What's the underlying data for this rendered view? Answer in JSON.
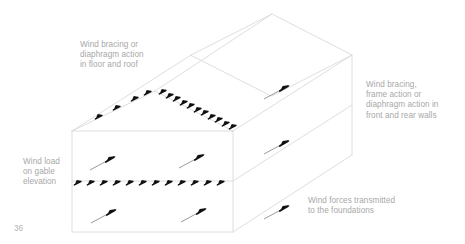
{
  "page": {
    "number": "36",
    "background_color": "#ffffff",
    "line_color": "#d9d9d9",
    "arrow_color": "#1a1a1a",
    "text_color": "#a8a8a8"
  },
  "annotations": {
    "roof_diaphragm": "Wind bracing or\ndiaphragm action\nin floor and roof",
    "side_walls": "Wind bracing,\nframe action or\ndiaphragm action in\nfront and rear walls",
    "gable_load": "Wind load\non gable\nelevation",
    "foundations": "Wind forces transmitted\nto the foundations"
  },
  "diagram": {
    "type": "axonometric-line-drawing",
    "building_outline": {
      "near_gable": {
        "eave_left": [
          72,
          131
        ],
        "eave_right": [
          233,
          131
        ],
        "base_left": [
          72,
          232
        ],
        "base_right": [
          233,
          232
        ],
        "apex": [
          155,
          91
        ]
      },
      "far_gable": {
        "eave_left": [
          191,
          55
        ],
        "eave_right": [
          352,
          55
        ],
        "base_right": [
          352,
          155
        ],
        "apex": [
          272,
          14
        ]
      },
      "mid_floor_line_y": 181
    },
    "arrow_groups": [
      {
        "name": "gable-mid-floor-arrows",
        "style": "short",
        "count": 12,
        "x_start": 78,
        "x_step": 13.2,
        "y": 181
      },
      {
        "name": "right-roof-eave-arrows",
        "style": "short",
        "count": 11,
        "from": [
          163,
          88
        ],
        "to": [
          232,
          124
        ]
      },
      {
        "name": "left-roof-slope-arrows",
        "style": "short",
        "count": 4,
        "from": [
          99,
          117
        ],
        "to": [
          148,
          93
        ]
      },
      {
        "name": "gable-upper-wall-long-arrows",
        "style": "long",
        "count": 2,
        "positions": [
          [
            89,
            169
          ],
          [
            178,
            166
          ]
        ]
      },
      {
        "name": "gable-lower-wall-long-arrows",
        "style": "long",
        "count": 2,
        "positions": [
          [
            90,
            222
          ],
          [
            180,
            221
          ]
        ]
      },
      {
        "name": "side-wall-upper-long-arrow",
        "style": "long",
        "count": 1,
        "positions": [
          [
            271,
            97
          ]
        ]
      },
      {
        "name": "side-wall-lower-long-arrow",
        "style": "long",
        "count": 1,
        "positions": [
          [
            271,
            152
          ]
        ]
      },
      {
        "name": "foundation-long-arrow",
        "style": "long",
        "count": 1,
        "positions": [
          [
            264,
            217
          ]
        ]
      }
    ]
  }
}
